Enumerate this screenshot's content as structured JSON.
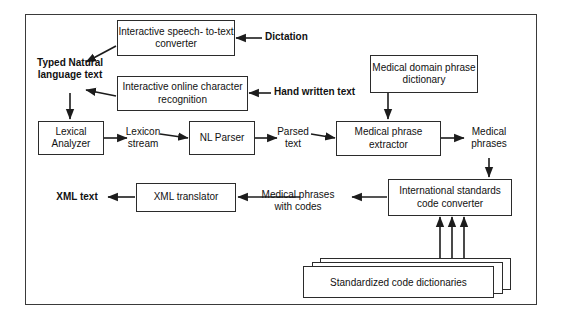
{
  "diagram": {
    "type": "flowchart",
    "outer_frame": {
      "label": ""
    },
    "nodes": [
      {
        "id": "speech",
        "label": "Interactive speech-\nto-text converter"
      },
      {
        "id": "handwriting",
        "label": "Interactive online\ncharacter recognition"
      },
      {
        "id": "domain_dict",
        "label": "Medical domain\nphrase dictionary"
      },
      {
        "id": "lexical",
        "label": "Lexical\nAnalyzer"
      },
      {
        "id": "parser",
        "label": "NL Parser"
      },
      {
        "id": "extractor",
        "label": "Medical phrase\nextractor"
      },
      {
        "id": "converter",
        "label": "International standards\ncode converter"
      },
      {
        "id": "xml_translator",
        "label": "XML translator"
      },
      {
        "id": "std_dicts",
        "label": "Standardized code dictionaries"
      }
    ],
    "labels": [
      {
        "id": "dictation",
        "text": "Dictation",
        "bold": true
      },
      {
        "id": "handwritten_text",
        "text": "Hand written text",
        "bold": true
      },
      {
        "id": "typed_text",
        "text": "Typed Natural\nlanguage text",
        "bold": true
      },
      {
        "id": "lexicon_stream",
        "text": "Lexicon\nstream",
        "bold": false
      },
      {
        "id": "parsed_text",
        "text": "Parsed\ntext",
        "bold": false
      },
      {
        "id": "medical_phrases",
        "text": "Medical\nphrases",
        "bold": false
      },
      {
        "id": "phrases_with_codes",
        "text": "Medical phrases\nwith codes",
        "bold": false
      },
      {
        "id": "xml_text",
        "text": "XML text",
        "bold": true
      }
    ],
    "edges": [
      {
        "from": "dictation",
        "to": "speech"
      },
      {
        "from": "speech",
        "to": "typed_text"
      },
      {
        "from": "handwritten_text",
        "to": "handwriting"
      },
      {
        "from": "handwriting",
        "to": "typed_text"
      },
      {
        "from": "typed_text",
        "to": "lexical"
      },
      {
        "from": "lexical",
        "to": "lexicon_stream"
      },
      {
        "from": "lexicon_stream",
        "to": "parser"
      },
      {
        "from": "parser",
        "to": "parsed_text"
      },
      {
        "from": "parsed_text",
        "to": "extractor"
      },
      {
        "from": "domain_dict",
        "to": "extractor"
      },
      {
        "from": "extractor",
        "to": "medical_phrases"
      },
      {
        "from": "medical_phrases",
        "to": "converter"
      },
      {
        "from": "std_dicts",
        "to": "converter"
      },
      {
        "from": "converter",
        "to": "phrases_with_codes"
      },
      {
        "from": "phrases_with_codes",
        "to": "xml_translator"
      },
      {
        "from": "xml_translator",
        "to": "xml_text"
      }
    ],
    "colors": {
      "stroke": "#2b2b2b",
      "frame": "#3a3a3a",
      "background": "#ffffff",
      "text": "#111111"
    }
  }
}
